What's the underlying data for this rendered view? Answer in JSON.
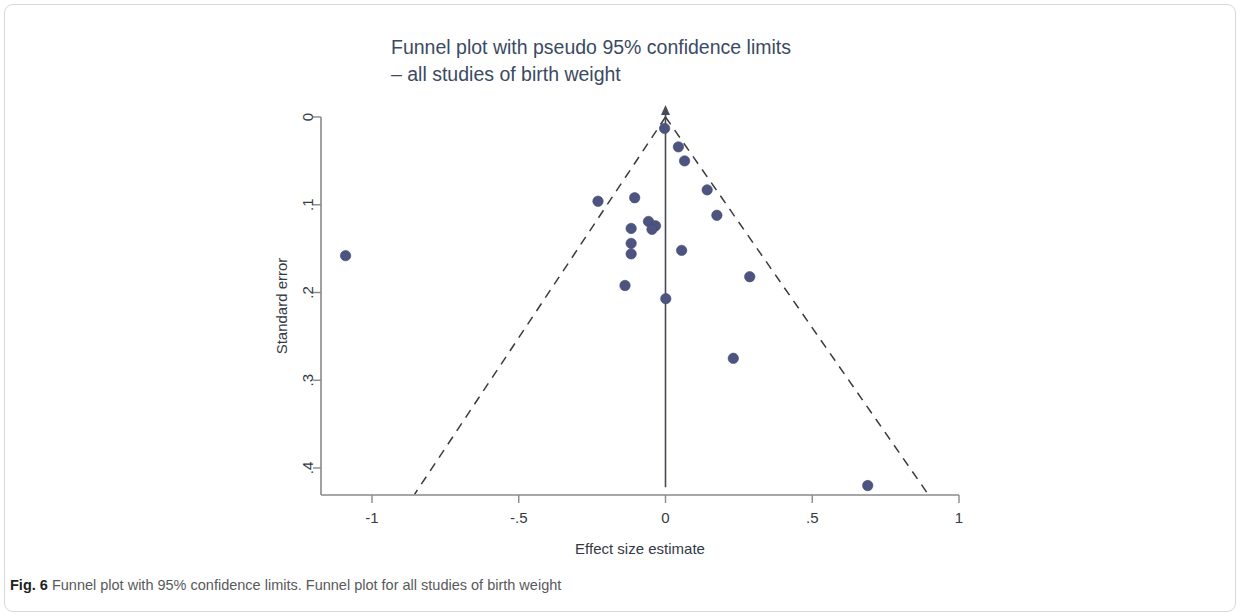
{
  "figure": {
    "caption_label": "Fig. 6",
    "caption_text": "Funnel plot with 95% confidence limits. Funnel plot for all studies of birth weight"
  },
  "chart_data": {
    "type": "scatter",
    "title": "Funnel plot with pseudo 95% confidence limits",
    "subtitle": "– all studies of birth weight",
    "xlabel": "Effect size estimate",
    "ylabel": "Standard error",
    "xlim": [
      -1.2,
      1.05
    ],
    "ylim": [
      0.43,
      0.0
    ],
    "y_axis_inverted": true,
    "grid": false,
    "legend": null,
    "xticks": [
      -1,
      -0.5,
      0,
      0.5,
      1
    ],
    "xtick_labels": [
      "-1",
      "-.5",
      "0",
      ".5",
      "1"
    ],
    "yticks": [
      0,
      0.1,
      0.2,
      0.3,
      0.4
    ],
    "ytick_labels": [
      "0",
      ".1",
      ".2",
      ".3",
      ".4"
    ],
    "point_color": "#4e5480",
    "point_radius": 5.2,
    "reference_line": {
      "name": "pooled-effect-line",
      "x": 0.0,
      "y_from": 0.0,
      "y_to": 0.422,
      "color": "#4a4a55",
      "style": "solid"
    },
    "confidence_limits": {
      "name": "pseudo-95-percent-limits",
      "apex": {
        "x": 0.0,
        "y": 0.0
      },
      "left_end": {
        "x": -0.855,
        "y": 0.43
      },
      "right_end": {
        "x": 0.895,
        "y": 0.43
      },
      "color": "#3a3a3a",
      "style": "dashed"
    },
    "points": [
      {
        "x": -1.09,
        "y": 0.158
      },
      {
        "x": -0.23,
        "y": 0.096
      },
      {
        "x": -0.105,
        "y": 0.092
      },
      {
        "x": -0.058,
        "y": 0.119
      },
      {
        "x": -0.034,
        "y": 0.124
      },
      {
        "x": -0.046,
        "y": 0.128
      },
      {
        "x": -0.117,
        "y": 0.127
      },
      {
        "x": -0.117,
        "y": 0.144
      },
      {
        "x": -0.117,
        "y": 0.156
      },
      {
        "x": -0.138,
        "y": 0.192
      },
      {
        "x": -0.003,
        "y": 0.013
      },
      {
        "x": 0.044,
        "y": 0.034
      },
      {
        "x": 0.065,
        "y": 0.05
      },
      {
        "x": 0.055,
        "y": 0.152
      },
      {
        "x": 0.001,
        "y": 0.207
      },
      {
        "x": 0.142,
        "y": 0.083
      },
      {
        "x": 0.175,
        "y": 0.112
      },
      {
        "x": 0.287,
        "y": 0.182
      },
      {
        "x": 0.231,
        "y": 0.275
      },
      {
        "x": 0.689,
        "y": 0.42
      }
    ]
  }
}
